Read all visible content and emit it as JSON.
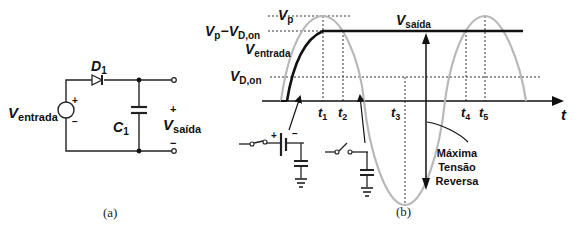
{
  "figure_a": {
    "caption": "(a)",
    "source_label_main": "V",
    "source_label_sub": "entrada",
    "source_plus": "+",
    "source_minus": "−",
    "diode_main": "D",
    "diode_sub": "1",
    "cap_main": "C",
    "cap_sub": "1",
    "out_main": "V",
    "out_sub": "saída",
    "out_plus": "+",
    "out_minus": "−"
  },
  "figure_b": {
    "caption": "(b)",
    "vp_main": "V",
    "vp_sub": "p",
    "vpd_main1": "V",
    "vpd_sub1": "p",
    "vpd_dash": "−",
    "vpd_main2": "V",
    "vpd_sub2": "D,on",
    "vin_main": "V",
    "vin_sub": "entrada",
    "vdon_main": "V",
    "vdon_sub": "D,on",
    "vout_main": "V",
    "vout_sub": "saída",
    "t_axis": "t",
    "ticks": [
      {
        "main": "t",
        "sub": "1"
      },
      {
        "main": "t",
        "sub": "2"
      },
      {
        "main": "t",
        "sub": "3"
      },
      {
        "main": "t",
        "sub": "4"
      },
      {
        "main": "t",
        "sub": "5"
      }
    ],
    "annotation_line1": "Máxima",
    "annotation_line2": "Tensão",
    "annotation_line3": "Reversa",
    "battery_plus": "+",
    "battery_minus": "−",
    "colors": {
      "input_wave": "#b8b8b8",
      "output_wave": "#111111"
    }
  }
}
